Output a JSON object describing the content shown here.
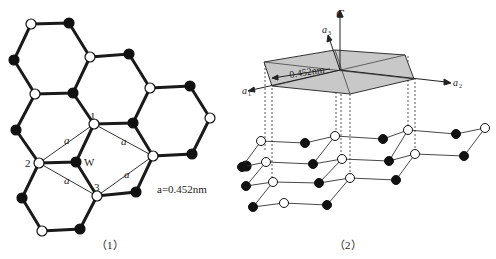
{
  "figure1": {
    "caption": "（1）",
    "node_labels": {
      "n1": "1",
      "n2": "2",
      "n3": "3",
      "w": "W"
    },
    "bond_label": "a",
    "lattice_constant_label": "a=0.452nm"
  },
  "figure2": {
    "caption": "（2）",
    "axis_c": "C",
    "axis_a1": "a",
    "axis_a1_sub": "1",
    "axis_a2": "a",
    "axis_a2_sub": "2",
    "axis_a3": "a",
    "axis_a3_sub": "3",
    "plate_dimension": "0.452nm"
  },
  "colors": {
    "line": "#1a1a1a",
    "filled_atom": "#111111",
    "open_atom": "#ffffff",
    "plate_fill": "#c8c8c8"
  }
}
